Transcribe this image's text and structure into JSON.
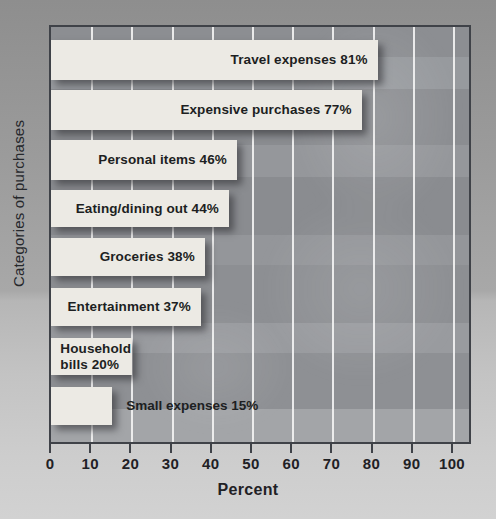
{
  "chart_data": {
    "type": "bar",
    "orientation": "horizontal",
    "title": "",
    "xlabel": "Percent",
    "ylabel": "Categories of purchases",
    "xlim": [
      0,
      100
    ],
    "xticks": [
      0,
      10,
      20,
      30,
      40,
      50,
      60,
      70,
      80,
      90,
      100
    ],
    "xticklabels": [
      "0",
      "10",
      "20",
      "30",
      "40",
      "50",
      "60",
      "70",
      "80",
      "90",
      "100"
    ],
    "grid": "vertical-only",
    "legend": "none",
    "categories": [
      "Travel expenses",
      "Expensive purchases",
      "Personal items",
      "Eating/dining out",
      "Groceries",
      "Entertainment",
      "Household bills",
      "Small expenses"
    ],
    "values": [
      81,
      77,
      46,
      44,
      38,
      37,
      20,
      15
    ],
    "bars": [
      {
        "category": "Travel expenses",
        "value": 81,
        "value_text": "81%",
        "label": "Travel expenses  81%",
        "label_placement": "inside-right"
      },
      {
        "category": "Expensive purchases",
        "value": 77,
        "value_text": "77%",
        "label": "Expensive purchases  77%",
        "label_placement": "inside-right"
      },
      {
        "category": "Personal items",
        "value": 46,
        "value_text": "46%",
        "label": "Personal items  46%",
        "label_placement": "inside-right"
      },
      {
        "category": "Eating/dining out",
        "value": 44,
        "value_text": "44%",
        "label": "Eating/dining out  44%",
        "label_placement": "inside-right"
      },
      {
        "category": "Groceries",
        "value": 38,
        "value_text": "38%",
        "label": "Groceries  38%",
        "label_placement": "inside-right"
      },
      {
        "category": "Entertainment",
        "value": 37,
        "value_text": "37%",
        "label": "Entertainment  37%",
        "label_placement": "inside-right"
      },
      {
        "category": "Household bills",
        "value": 20,
        "value_text": "20%",
        "label_line1": "Household",
        "label_line2": "bills  20%",
        "label": "Household bills  20%",
        "label_placement": "inside-two-line"
      },
      {
        "category": "Small expenses",
        "value": 15,
        "value_text": "15%",
        "label": "Small expenses 15%",
        "label_placement": "outside-right"
      }
    ],
    "colors": {
      "bar_fill": "#eceae4",
      "plot_background": "#8f9195",
      "gridline": "#f2f2f2",
      "axis_line": "#3f4248",
      "text": "#1d1f22",
      "figure_background": "#a8a8a8"
    }
  }
}
